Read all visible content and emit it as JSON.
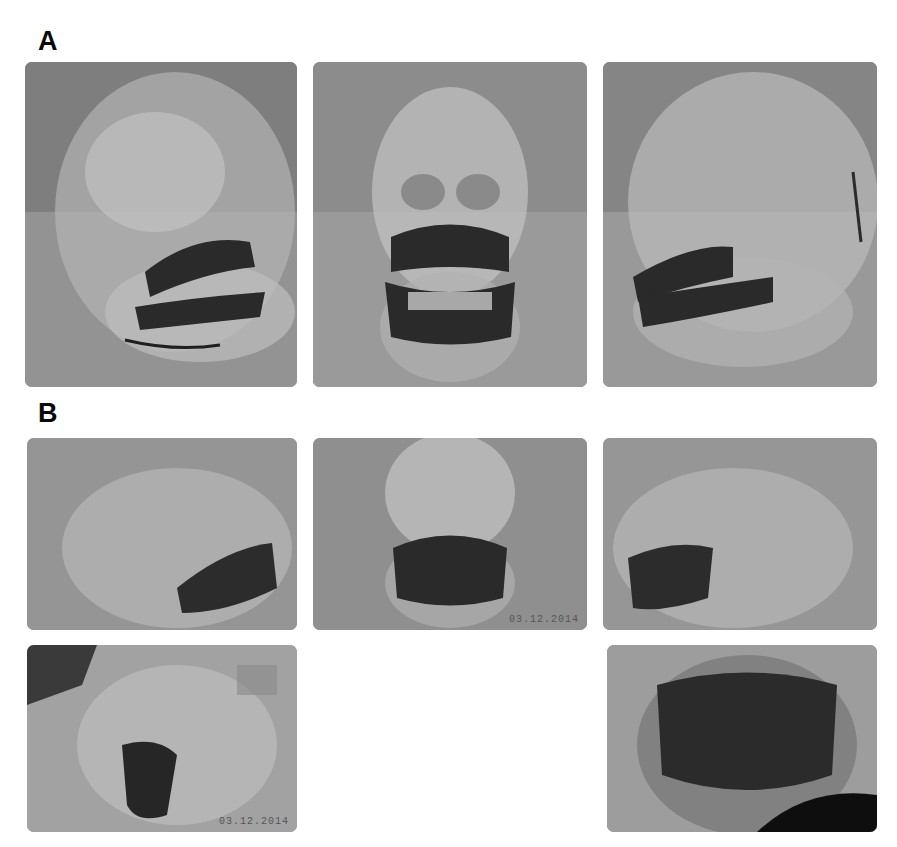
{
  "figure": {
    "panels": [
      {
        "label": "A",
        "description": "Transparent skull model with dark-marked teeth, three views"
      },
      {
        "label": "B",
        "description": "Transparent skull model photographs, multiple views"
      }
    ],
    "images": [
      {
        "id": "A1",
        "view": "left-oblique lateral view of transparent skull with dark teeth"
      },
      {
        "id": "A2",
        "view": "frontal view of transparent skull with dark teeth"
      },
      {
        "id": "A3",
        "view": "right-oblique lateral view of transparent skull with dark teeth"
      },
      {
        "id": "B1",
        "view": "left lateral view, tilted skull"
      },
      {
        "id": "B2",
        "view": "frontal view of lower face",
        "timestamp": "03.12.2014"
      },
      {
        "id": "B3",
        "view": "right lateral view, tilted skull"
      },
      {
        "id": "B4",
        "view": "close-up oblique view held in hand",
        "timestamp": "03.12.2014"
      },
      {
        "id": "B5",
        "view": "close-up frontal view of jaw held in hand"
      }
    ]
  },
  "colors": {
    "background": "#ffffff",
    "photo_base": "#8f8f8f",
    "teeth_dark": "#2a2a2a",
    "label": "#0a0a0a"
  }
}
